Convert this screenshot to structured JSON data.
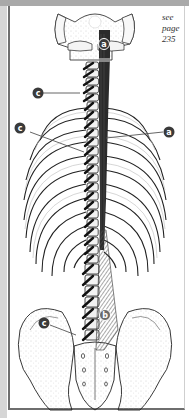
{
  "figure": {
    "cross_reference": {
      "line1": "see",
      "line2": "page",
      "line3": "235"
    },
    "labels": [
      {
        "id": "a-top",
        "letter": "a"
      },
      {
        "id": "c-neck",
        "letter": "c"
      },
      {
        "id": "c-thorax",
        "letter": "c"
      },
      {
        "id": "a-thorax",
        "letter": "a"
      },
      {
        "id": "c-lumbar",
        "letter": "c"
      },
      {
        "id": "b-lumbar",
        "letter": "b"
      }
    ],
    "colors": {
      "label_fill": "#3a3a3a",
      "muscle_dark": "#2b2b2b",
      "muscle_hatch": "#6a6a6a",
      "bone": "#f4f4f4",
      "outline": "#222222",
      "frame": "#6e6e6e",
      "top_bar": "#a9a9a9"
    }
  }
}
